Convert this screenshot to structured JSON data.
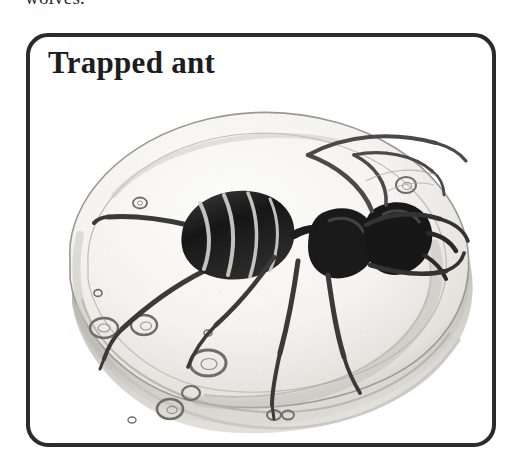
{
  "page": {
    "background_color": "#ffffff",
    "ink_color": "#2a2a2a",
    "width_px": 523,
    "height_px": 467
  },
  "body_text": {
    "cut_off_line": "wolves."
  },
  "figure": {
    "title": "Trapped ant",
    "frame": {
      "style": "rounded-rectangle",
      "border_color": "#2a2a2a",
      "border_width_px": 4,
      "corner_radius_px": 22
    },
    "illustration": {
      "medium": "graphite pencil drawing",
      "subject": "ant preserved inside a piece of amber",
      "palette": {
        "amber_fill": "#f2f1ee",
        "amber_shadow": "#b9b7b2",
        "amber_outline": "#8e8c88",
        "ant_body": "#1c1c1c",
        "ant_midtone": "#4a4a4a",
        "bubble_outline": "#6d6b67"
      },
      "elements": [
        "amber nodule (rounded triangular blob)",
        "beveled lower rim of amber",
        "ant with banded gaster",
        "ant head and mandibles",
        "six legs",
        "two antennae",
        "trapped air bubbles"
      ],
      "bubble_count": 11
    }
  }
}
